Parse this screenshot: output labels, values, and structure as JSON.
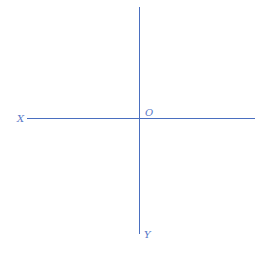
{
  "diagram": {
    "type": "coordinate-axes",
    "labels": {
      "x_axis": "X",
      "y_axis": "Y",
      "origin": "O"
    },
    "colors": {
      "axis": "#4a6fc0",
      "label": "#5a7ac8",
      "background": "#ffffff"
    }
  }
}
